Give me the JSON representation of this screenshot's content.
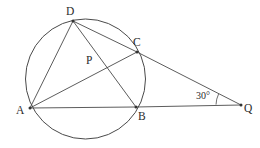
{
  "figure": {
    "background_color": "#ffffff",
    "stroke_color": "#4a4a4a",
    "label_color": "#2b2b2b",
    "width": 260,
    "height": 148
  },
  "circle": {
    "name": "main-circle",
    "cx": 85.5,
    "cy": 79,
    "r": 60
  },
  "points": [
    {
      "id": "A",
      "label": "A",
      "x": 30,
      "y": 108,
      "label_x": 16,
      "label_y": 114,
      "on_circle": true,
      "dot": true
    },
    {
      "id": "B",
      "label": "B",
      "x": 136,
      "y": 107,
      "label_x": 138,
      "label_y": 120,
      "on_circle": true,
      "dot": true
    },
    {
      "id": "C",
      "label": "C",
      "x": 137,
      "y": 52,
      "label_x": 133,
      "label_y": 46,
      "on_circle": true,
      "dot": true
    },
    {
      "id": "D",
      "label": "D",
      "x": 73,
      "y": 21,
      "label_x": 66,
      "label_y": 15,
      "on_circle": true,
      "dot": true
    },
    {
      "id": "P",
      "label": "P",
      "x": 103,
      "y": 64,
      "label_x": 86,
      "label_y": 64,
      "on_circle": false,
      "dot": false
    },
    {
      "id": "Q",
      "label": "Q",
      "x": 241,
      "y": 105,
      "label_x": 244,
      "label_y": 112,
      "on_circle": false,
      "dot": true
    }
  ],
  "segments": [
    {
      "name": "segment-A-D",
      "from": "A",
      "to": "D"
    },
    {
      "name": "segment-A-C",
      "from": "A",
      "to": "C"
    },
    {
      "name": "segment-D-B",
      "from": "D",
      "to": "B"
    },
    {
      "name": "segment-A-B",
      "from": "A",
      "to": "B"
    },
    {
      "name": "segment-B-Q",
      "from": "B",
      "to": "Q"
    },
    {
      "name": "segment-D-C",
      "from": "D",
      "to": "C"
    },
    {
      "name": "segment-C-Q",
      "from": "C",
      "to": "Q"
    }
  ],
  "angle": {
    "name": "angle-at-Q",
    "label": "30°",
    "value": 30,
    "unit": "degrees",
    "vertex": "Q",
    "label_x": 196,
    "label_y": 99,
    "arc_path": "M 216 104.6 A 26 26 0 0 1 218.6 94.0"
  }
}
